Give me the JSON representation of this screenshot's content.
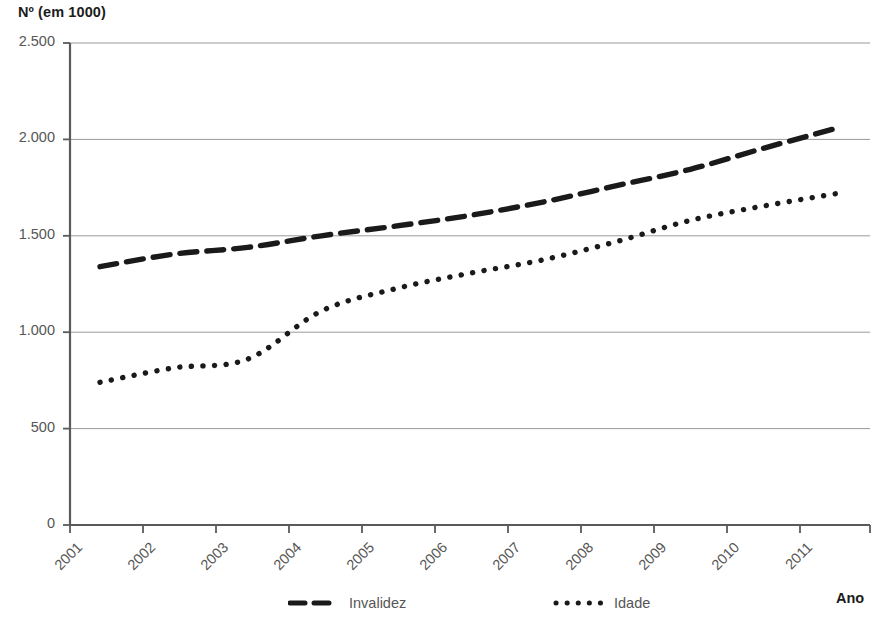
{
  "axes": {
    "y_title": "Nº (em 1000)",
    "x_title": "Ano",
    "y_ticks": [
      "0",
      "500",
      "1.000",
      "1.500",
      "2.000",
      "2.500"
    ],
    "x_ticks": [
      "2001",
      "2002",
      "2003",
      "2004",
      "2005",
      "2006",
      "2007",
      "2008",
      "2009",
      "2010",
      "2011"
    ]
  },
  "legend": {
    "items": [
      {
        "label": "Invalidez",
        "style": "dashed",
        "color": "#1a1a1a"
      },
      {
        "label": "Idade",
        "style": "dotted",
        "color": "#1a1a1a"
      }
    ]
  },
  "colors": {
    "series": "#1a1a1a",
    "axis": "#5a5a5a",
    "gridline": "#9a9a9a",
    "tick_text": "#565656",
    "title_text": "#1c1c1c",
    "background": "#ffffff"
  },
  "chart_data": {
    "type": "line",
    "title": "",
    "subtitle": "",
    "xlabel": "Ano",
    "ylabel": "Nº (em 1000)",
    "x": [
      2001,
      2002,
      2003,
      2004,
      2005,
      2006,
      2007,
      2008,
      2009,
      2010,
      2011
    ],
    "xlim": [
      2001,
      2011
    ],
    "ylim": [
      0,
      2500
    ],
    "ytick_values": [
      0,
      500,
      1000,
      1500,
      2000,
      2500
    ],
    "grid": "horizontal",
    "legend_position": "bottom",
    "series": [
      {
        "name": "Invalidez",
        "style": "dashed",
        "values": [
          1340,
          1405,
          1440,
          1500,
          1550,
          1605,
          1675,
          1760,
          1845,
          1955,
          2060
        ]
      },
      {
        "name": "Idade",
        "style": "dotted",
        "values": [
          740,
          815,
          860,
          1110,
          1225,
          1305,
          1375,
          1470,
          1580,
          1655,
          1720
        ]
      }
    ]
  }
}
